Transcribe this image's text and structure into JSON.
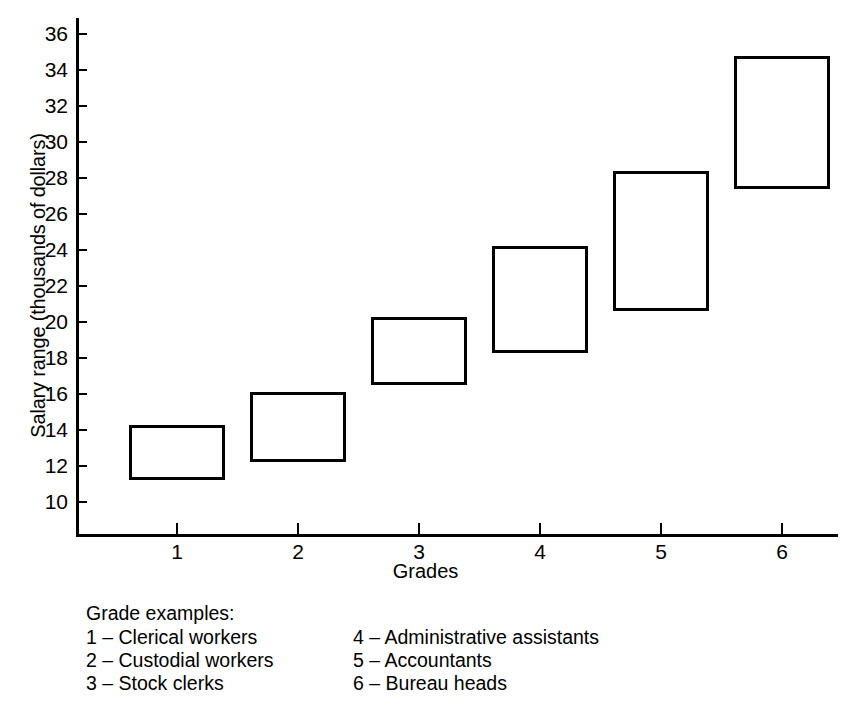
{
  "chart_data": {
    "type": "bar",
    "title": "",
    "xlabel": "Grades",
    "ylabel": "Salary range (thousands of dollars)",
    "categories": [
      "1",
      "2",
      "3",
      "4",
      "5",
      "6"
    ],
    "xlim": [
      0.5,
      6.5
    ],
    "ylim": [
      9.2,
      36.9
    ],
    "yticks": [
      10,
      12,
      14,
      16,
      18,
      20,
      22,
      24,
      26,
      28,
      30,
      32,
      34,
      36
    ],
    "grid": false,
    "legend": "none",
    "note": "Each grade is drawn as an open rectangle spanning its minimum to maximum salary.",
    "ranges": [
      {
        "grade": "1",
        "low": 11.2,
        "high": 14.3
      },
      {
        "grade": "2",
        "low": 12.2,
        "high": 16.1
      },
      {
        "grade": "3",
        "low": 16.5,
        "high": 20.3
      },
      {
        "grade": "4",
        "low": 18.3,
        "high": 24.2
      },
      {
        "grade": "5",
        "low": 20.6,
        "high": 28.4
      },
      {
        "grade": "6",
        "low": 27.4,
        "high": 34.8
      }
    ]
  },
  "axes": {
    "y_title": "Salary range (thousands of dollars)",
    "x_title": "Grades",
    "y_tick_labels": [
      "36",
      "34",
      "32",
      "30",
      "28",
      "26",
      "24",
      "22",
      "20",
      "18",
      "16",
      "14",
      "12",
      "10"
    ],
    "x_tick_labels": [
      "1",
      "2",
      "3",
      "4",
      "5",
      "6"
    ]
  },
  "legend": {
    "title": "Grade examples:",
    "left_items": [
      "1 – Clerical workers",
      "2 – Custodial workers",
      "3 – Stock clerks"
    ],
    "right_items": [
      "4 – Administrative assistants",
      "5 – Accountants",
      "6 – Bureau heads"
    ]
  },
  "colors": {
    "ink": "#000000",
    "background": "#ffffff"
  }
}
